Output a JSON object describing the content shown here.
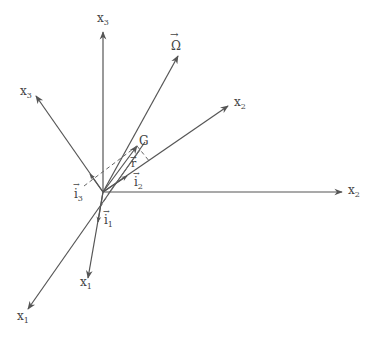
{
  "diagram": {
    "origin": {
      "x": 103,
      "y": 192
    },
    "labels": {
      "x3_fixed": {
        "base": "x",
        "sub": "3"
      },
      "x3_body": {
        "base": "x",
        "sub": "3"
      },
      "omega": {
        "text": "Ω",
        "arrow": "→"
      },
      "x2_body": {
        "base": "x",
        "sub": "2"
      },
      "x2_fixed": {
        "base": "x",
        "sub": "2"
      },
      "x1_body": {
        "base": "x",
        "sub": "1"
      },
      "x1_fixed": {
        "base": "x",
        "sub": "1"
      },
      "G": {
        "text": "G"
      },
      "r": {
        "text": "r",
        "arrow": "→"
      },
      "i1": {
        "base": "i",
        "sub": "1",
        "arrow": "→"
      },
      "i2": {
        "base": "i",
        "sub": "2",
        "arrow": "→"
      },
      "i3": {
        "base": "i",
        "sub": "3",
        "arrow": "→"
      }
    },
    "colors": {
      "line": "#555555",
      "text": "#444444",
      "background": "#ffffff"
    }
  }
}
